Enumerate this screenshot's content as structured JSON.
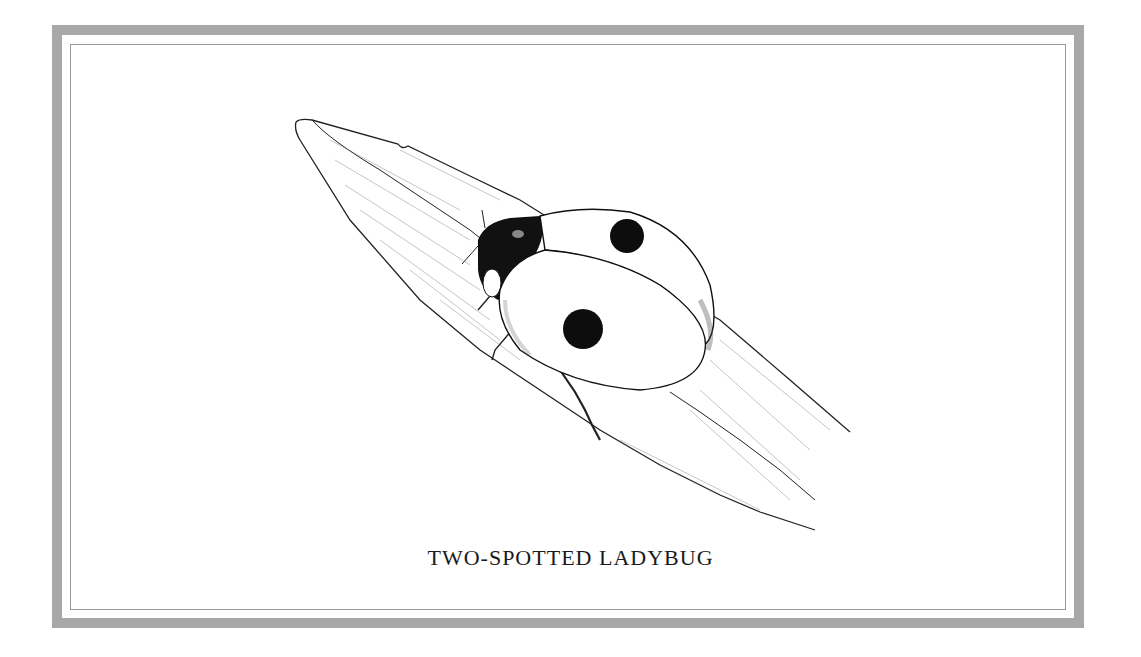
{
  "plate": {
    "caption": "TWO-SPOTTED LADYBUG",
    "frame_color": "#a8a8a8",
    "inner_line_color": "#9a9a9a",
    "ink_color": "#111111"
  },
  "illustration": {
    "subject": "two-spotted ladybug on a leaf",
    "spots": 2,
    "style": "pen-and-ink stipple drawing"
  }
}
